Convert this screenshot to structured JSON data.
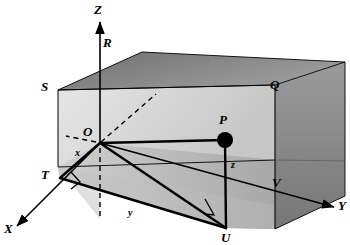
{
  "figure": {
    "background_color": "#ffffff",
    "stroke_color": "#000000",
    "face_colors": {
      "top": "#8a8a8a",
      "right": "#828282",
      "left": "#e8e8e8",
      "inner_back": "#d9d9d9",
      "floor": "#bdbdbd",
      "floor_light": "#cfcfcf"
    }
  },
  "axes": [
    {
      "name": "x-axis",
      "label": "X",
      "x": 340,
      "y": 206
    },
    {
      "name": "y-axis",
      "label": "Y",
      "x": 9,
      "y": 230
    },
    {
      "name": "z-axis",
      "label": "Z",
      "x": 96,
      "y": 6
    }
  ],
  "axis_labels": {
    "x": "X",
    "y": "Y",
    "z": "Z"
  },
  "vertices": [
    {
      "name": "origin",
      "label": "O"
    },
    {
      "name": "point-p",
      "label": "P"
    },
    {
      "name": "point-q",
      "label": "Q"
    },
    {
      "name": "point-r",
      "label": "R"
    },
    {
      "name": "point-s",
      "label": "S"
    },
    {
      "name": "point-t",
      "label": "T"
    },
    {
      "name": "point-u",
      "label": "U"
    },
    {
      "name": "point-v",
      "label": "V"
    }
  ],
  "vertex_labels": {
    "O": "O",
    "P": "P",
    "Q": "Q",
    "R": "R",
    "S": "S",
    "T": "T",
    "U": "U",
    "V": "V"
  },
  "distance_labels": {
    "x": "x",
    "y": "y",
    "z": "z"
  },
  "markers": {
    "point_p_dot": "filled-circle",
    "right_angle_at_t": "right-angle-square",
    "right_angle_at_u": "right-angle-square"
  }
}
